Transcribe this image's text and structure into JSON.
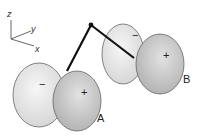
{
  "figure": {
    "axes": {
      "z_label": "z",
      "y_label": "y",
      "x_label": "x"
    },
    "orbital_a": {
      "label": "A",
      "back_lobe_sign": "−",
      "front_lobe_sign": "+"
    },
    "orbital_b": {
      "label": "B",
      "back_lobe_sign": "−",
      "front_lobe_sign": "+"
    },
    "colors": {
      "light_lobe": "#e4e4e4",
      "dark_lobe": "#b9b9b9",
      "outline": "#555555",
      "bond": "#111111"
    }
  }
}
